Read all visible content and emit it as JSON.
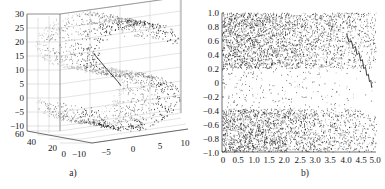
{
  "figure": {
    "panels": [
      {
        "id": "a",
        "caption": "a)",
        "kind": "scatter3d"
      },
      {
        "id": "b",
        "caption": "b)",
        "kind": "scatter"
      }
    ]
  },
  "chart_data": [
    {
      "type": "scatter",
      "id": "panel-a",
      "title": "",
      "subtitle": "",
      "caption": "a)",
      "projection": "3d",
      "xlabel": "",
      "ylabel": "",
      "zlabel": "",
      "xlim": [
        -10,
        10
      ],
      "ylim": [
        0,
        60
      ],
      "zlim": [
        -10,
        30
      ],
      "xticks": [
        -10,
        -5,
        0,
        5,
        10
      ],
      "yticks": [
        0,
        20,
        40,
        60
      ],
      "zticks": [
        -10,
        -5,
        0,
        5,
        10,
        15,
        20,
        25,
        30
      ],
      "xticklabels": [
        "-10",
        "-5",
        "0",
        "5",
        "10"
      ],
      "yticklabels": [
        "0",
        "20",
        "40",
        "60"
      ],
      "zticklabels": [
        "-10",
        "-5",
        "0",
        "5",
        "10",
        "15",
        "20",
        "25",
        "30"
      ],
      "grid": true,
      "legend": null,
      "marker_color": "#1c1c1c",
      "marker_size": 0.8,
      "n_points": 2000,
      "manifold": "s-curve",
      "annotations": [
        {
          "kind": "geodesic-path",
          "color": "#2b2b2b",
          "points": [
            [
              -4.6,
              22.0,
              17.6
            ],
            [
              -3.9,
              19.0,
              15.0
            ],
            [
              -3.4,
              15.0,
              12.4
            ],
            [
              -3.0,
              11.0,
              10.2
            ],
            [
              -2.8,
              8.0,
              8.7
            ],
            [
              -2.9,
              5.0,
              7.6
            ]
          ]
        }
      ]
    },
    {
      "type": "scatter",
      "id": "panel-b",
      "title": "",
      "subtitle": "",
      "caption": "b)",
      "projection": "2d",
      "xlabel": "",
      "ylabel": "",
      "xlim": [
        0,
        5.0
      ],
      "ylim": [
        -1.0,
        1.0
      ],
      "xticks": [
        0,
        0.5,
        1.0,
        1.5,
        2.0,
        2.5,
        3.0,
        3.5,
        4.0,
        4.5,
        5.0
      ],
      "yticks": [
        1.0,
        0.8,
        0.6,
        0.4,
        0.2,
        0,
        -0.2,
        -0.4,
        -0.6,
        -0.8,
        -1.0
      ],
      "xticklabels": [
        "0",
        "0.5",
        "1.0",
        "1.5",
        "2.0",
        "2.5",
        "3.0",
        "3.5",
        "4.0",
        "4.5",
        "5.0"
      ],
      "yticklabels": [
        "1.0",
        "0.8",
        "0.6",
        "0.4",
        "0.2",
        "0",
        "-0.2",
        "-0.4",
        "-0.6",
        "-0.8",
        "-1.0"
      ],
      "grid": false,
      "legend": null,
      "marker_color": "#1c1c1c",
      "marker_size": 0.7,
      "n_points": 4000,
      "density_note": "dense bands near y in [0.2,1.0] and y in [-1.0,-0.4]; sparse band near y in [-0.4,0.2]; density decreases with increasing x",
      "annotations": [
        {
          "kind": "descending-curve",
          "color": "#2b2b2b",
          "points": [
            [
              4.05,
              0.7
            ],
            [
              4.12,
              0.58
            ],
            [
              4.2,
              0.6
            ],
            [
              4.26,
              0.49
            ],
            [
              4.33,
              0.52
            ],
            [
              4.38,
              0.4
            ],
            [
              4.45,
              0.43
            ],
            [
              4.5,
              0.31
            ],
            [
              4.56,
              0.33
            ],
            [
              4.6,
              0.2
            ],
            [
              4.66,
              0.22
            ],
            [
              4.7,
              0.1
            ],
            [
              4.75,
              0.12
            ],
            [
              4.79,
              0.01
            ],
            [
              4.83,
              0.03
            ],
            [
              4.86,
              -0.07
            ]
          ]
        }
      ]
    }
  ]
}
